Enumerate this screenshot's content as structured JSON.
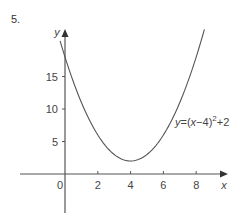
{
  "question_number": "5.",
  "chart_data": {
    "type": "line",
    "title": "",
    "xlabel": "x",
    "ylabel": "y",
    "xlim": [
      -0.3,
      8.5
    ],
    "ylim": [
      -6.5,
      22
    ],
    "x_ticks": [
      0,
      2,
      4,
      6,
      8
    ],
    "y_ticks": [
      5,
      10,
      15
    ],
    "grid": false,
    "series": [
      {
        "name": "y=(x−4)^2+2",
        "equation": "y=(x-4)^2+2",
        "vertex": [
          4,
          2
        ],
        "x": [
          -0.3,
          0,
          1,
          2,
          3,
          4,
          5,
          6,
          7,
          8,
          8.5
        ],
        "values": [
          20.49,
          18,
          11,
          6,
          3,
          2,
          3,
          6,
          11,
          18,
          22.25
        ]
      }
    ],
    "annotations": [
      {
        "text": "y=(x−4)²+2",
        "near_x": 7.1,
        "near_y": 11.5
      }
    ]
  },
  "labels": {
    "x_axis": "x",
    "y_axis": "y",
    "origin": "0",
    "x_tick_2": "2",
    "x_tick_4": "4",
    "x_tick_6": "6",
    "x_tick_8": "8",
    "y_tick_5": "5",
    "y_tick_10": "10",
    "y_tick_15": "15",
    "equation_prefix": "y",
    "equation_mid": "=(",
    "equation_x": "x",
    "equation_rest": "−4)",
    "equation_exp": "2",
    "equation_tail": "+2"
  }
}
